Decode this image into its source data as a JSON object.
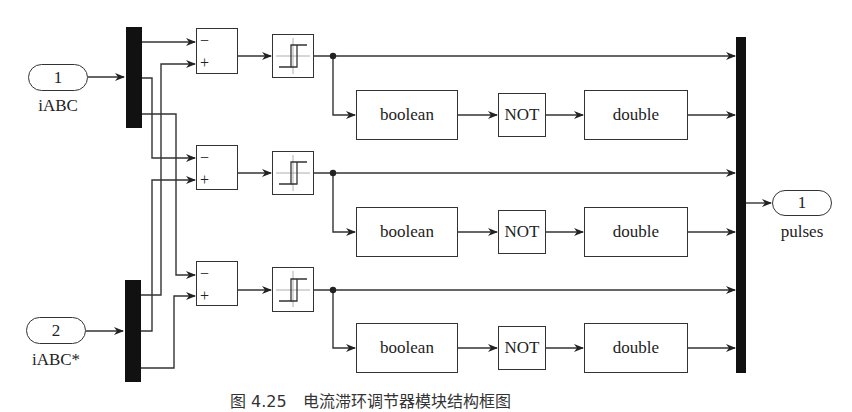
{
  "diagram": {
    "type": "simulink-block-diagram",
    "inputs": [
      {
        "port_number": "1",
        "label": "iABC"
      },
      {
        "port_number": "2",
        "label": "iABC*"
      }
    ],
    "output": {
      "port_number": "1",
      "label": "pulses"
    },
    "phases": [
      {
        "sum": {
          "minus": "−",
          "plus": "+"
        },
        "relay": "hysteresis-relay",
        "convert1": "boolean",
        "logic": "NOT",
        "convert2": "double"
      },
      {
        "sum": {
          "minus": "−",
          "plus": "+"
        },
        "relay": "hysteresis-relay",
        "convert1": "boolean",
        "logic": "NOT",
        "convert2": "double"
      },
      {
        "sum": {
          "minus": "−",
          "plus": "+"
        },
        "relay": "hysteresis-relay",
        "convert1": "boolean",
        "logic": "NOT",
        "convert2": "double"
      }
    ],
    "caption": "图 4.25　电流滞环调节器模块结构框图"
  },
  "colors": {
    "line": "#333333",
    "bar": "#111111",
    "background": "#ffffff"
  }
}
